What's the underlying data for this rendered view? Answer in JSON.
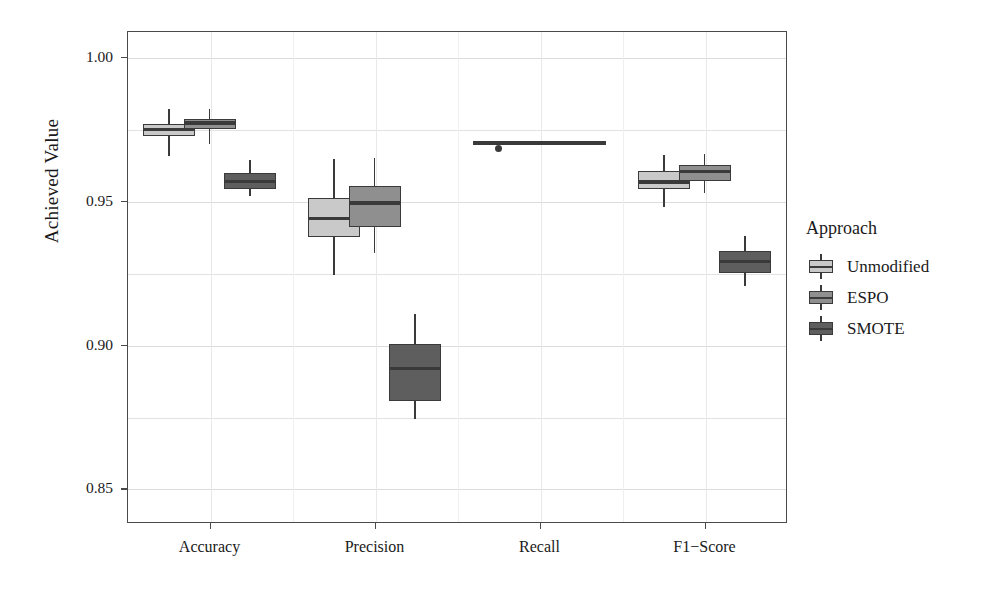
{
  "chart_data": {
    "type": "box",
    "title": "",
    "xlabel": "",
    "ylabel": "Achieved Value",
    "ylim": [
      0.838,
      1.009
    ],
    "yticks": [
      "1.00",
      "0.95",
      "0.90",
      "0.85"
    ],
    "ytick_values": [
      1.0,
      0.95,
      0.9,
      0.85
    ],
    "categories": [
      "Accuracy",
      "Precision",
      "Recall",
      "F1−Score"
    ],
    "grid": true,
    "legend": {
      "title": "Approach",
      "position": "right",
      "entries": [
        {
          "name": "Unmodified",
          "color": "#c9c9c9"
        },
        {
          "name": "ESPO",
          "color": "#8f8f8f"
        },
        {
          "name": "SMOTE",
          "color": "#5e5e5e"
        }
      ]
    },
    "series": [
      {
        "name": "Unmodified",
        "color": "#c9c9c9",
        "boxes": [
          {
            "category": "Accuracy",
            "lower_whisker": 0.9655,
            "q1": 0.9725,
            "median": 0.9747,
            "q3": 0.9768,
            "upper_whisker": 0.9818,
            "outliers": []
          },
          {
            "category": "Precision",
            "lower_whisker": 0.9243,
            "q1": 0.9375,
            "median": 0.9437,
            "q3": 0.951,
            "upper_whisker": 0.9645,
            "outliers": []
          },
          {
            "category": "Recall",
            "lower_whisker": 0.97,
            "q1": 0.97,
            "median": 0.97,
            "q3": 0.97,
            "upper_whisker": 0.97,
            "outliers": [
              0.9682
            ]
          },
          {
            "category": "F1−Score",
            "lower_whisker": 0.9478,
            "q1": 0.954,
            "median": 0.9565,
            "q3": 0.9605,
            "upper_whisker": 0.966,
            "outliers": []
          }
        ]
      },
      {
        "name": "ESPO",
        "color": "#8f8f8f",
        "boxes": [
          {
            "category": "Accuracy",
            "lower_whisker": 0.9697,
            "q1": 0.9748,
            "median": 0.977,
            "q3": 0.9785,
            "upper_whisker": 0.982,
            "outliers": []
          },
          {
            "category": "Precision",
            "lower_whisker": 0.9318,
            "q1": 0.941,
            "median": 0.9492,
            "q3": 0.9553,
            "upper_whisker": 0.9648,
            "outliers": []
          },
          {
            "category": "Recall",
            "lower_whisker": 0.97,
            "q1": 0.97,
            "median": 0.97,
            "q3": 0.97,
            "upper_whisker": 0.97,
            "outliers": []
          },
          {
            "category": "F1−Score",
            "lower_whisker": 0.9528,
            "q1": 0.957,
            "median": 0.9603,
            "q3": 0.9625,
            "upper_whisker": 0.9662,
            "outliers": []
          }
        ]
      },
      {
        "name": "SMOTE",
        "color": "#5e5e5e",
        "boxes": [
          {
            "category": "Accuracy",
            "lower_whisker": 0.9515,
            "q1": 0.954,
            "median": 0.9568,
            "q3": 0.9595,
            "upper_whisker": 0.964,
            "outliers": []
          },
          {
            "category": "Precision",
            "lower_whisker": 0.8742,
            "q1": 0.8805,
            "median": 0.8918,
            "q3": 0.9003,
            "upper_whisker": 0.9105,
            "outliers": []
          },
          {
            "category": "Recall",
            "lower_whisker": 0.97,
            "q1": 0.97,
            "median": 0.97,
            "q3": 0.97,
            "upper_whisker": 0.97,
            "outliers": []
          },
          {
            "category": "F1−Score",
            "lower_whisker": 0.9203,
            "q1": 0.925,
            "median": 0.9288,
            "q3": 0.9325,
            "upper_whisker": 0.9378,
            "outliers": []
          }
        ]
      }
    ]
  }
}
